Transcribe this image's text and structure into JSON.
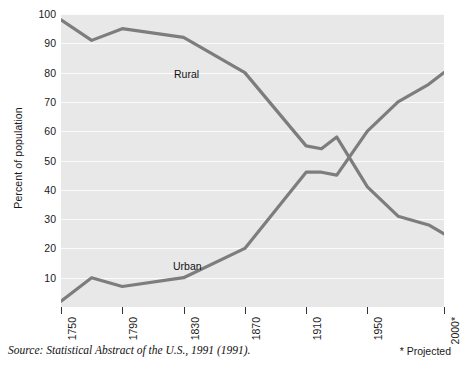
{
  "axis": {
    "ylabel": "Percent of population",
    "yticks": [
      10,
      20,
      30,
      40,
      50,
      60,
      70,
      80,
      90,
      100
    ],
    "xticks": [
      "1750",
      "1790",
      "1830",
      "1870",
      "1910",
      "1950",
      "2000*"
    ]
  },
  "labels": {
    "rural": "Rural",
    "urban": "Urban"
  },
  "notes": {
    "source": "Source: Statistical Abstract of the U.S., 1991 (1991).",
    "projected": "* Projected"
  },
  "colors": {
    "line": "#7d7d7d",
    "plot_background": "#e8e8e8",
    "gridline": "#fbfbfb",
    "text": "#1a1a1a"
  },
  "chart_data": {
    "type": "line",
    "title": "",
    "xlabel": "",
    "ylabel": "Percent of population",
    "xlim": [
      1750,
      2000
    ],
    "ylim": [
      0,
      100
    ],
    "grid": true,
    "legend": "inline-labels",
    "xticks": [
      1750,
      1790,
      1830,
      1870,
      1910,
      1950,
      2000
    ],
    "xtick_labels": [
      "1750",
      "1790",
      "1830",
      "1870",
      "1910",
      "1950",
      "2000*"
    ],
    "yticks": [
      10,
      20,
      30,
      40,
      50,
      60,
      70,
      80,
      90,
      100
    ],
    "annotations": [
      "* Projected"
    ],
    "series": [
      {
        "name": "Rural",
        "x": [
          1750,
          1770,
          1790,
          1830,
          1870,
          1910,
          1920,
          1930,
          1950,
          1970,
          1990,
          2000
        ],
        "values": [
          98,
          91,
          95,
          92,
          80,
          55,
          54,
          58,
          41,
          31,
          28,
          25
        ]
      },
      {
        "name": "Urban",
        "x": [
          1750,
          1770,
          1790,
          1830,
          1870,
          1910,
          1920,
          1930,
          1950,
          1970,
          1990,
          2000
        ],
        "values": [
          2,
          10,
          7,
          10,
          20,
          46,
          46,
          45,
          60,
          70,
          76,
          80
        ]
      }
    ]
  }
}
